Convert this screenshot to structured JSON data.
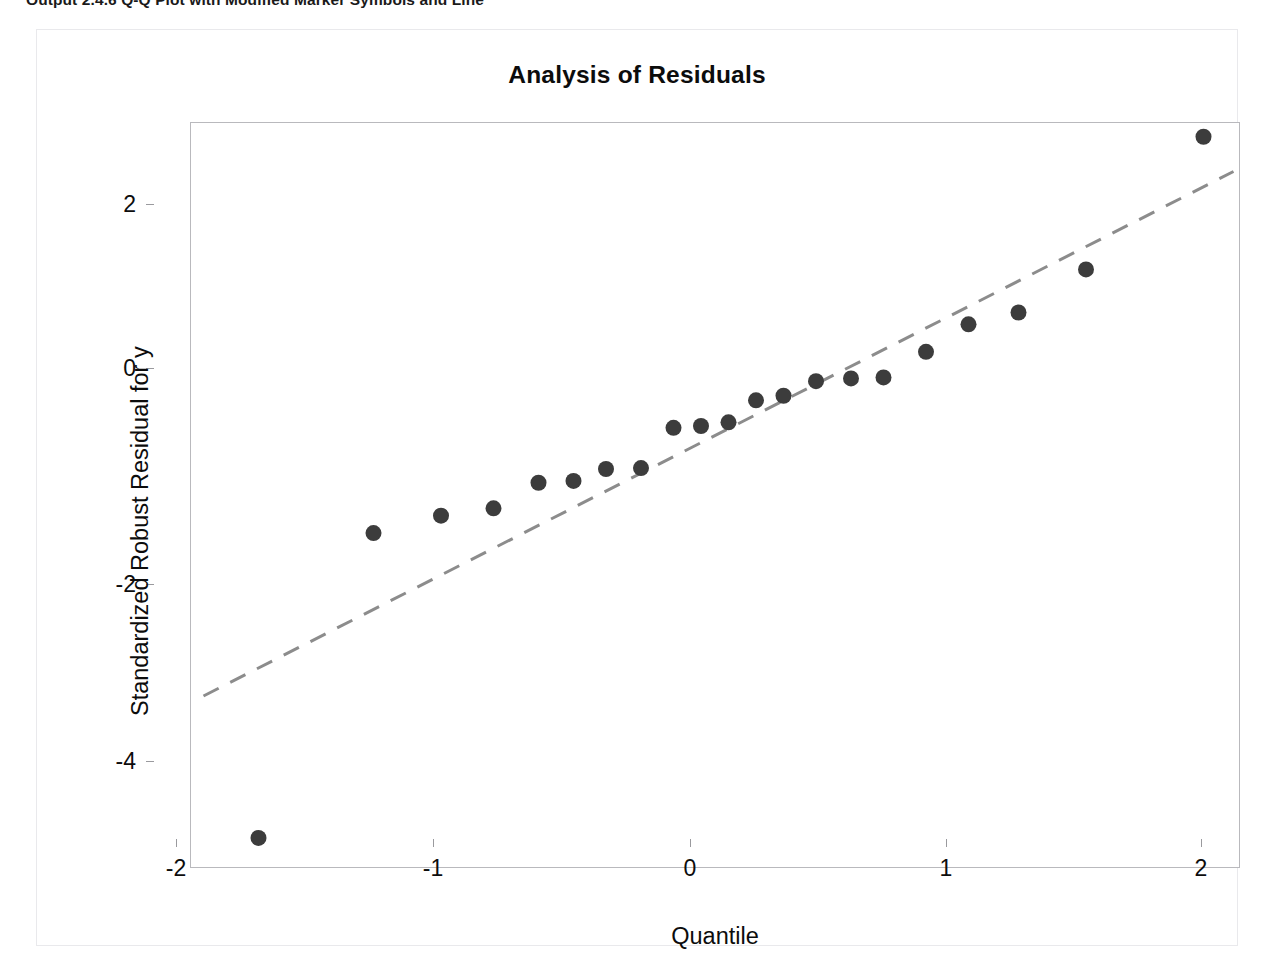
{
  "caption": {
    "text": "Output 2.4.6  Q-Q Plot with Modified Marker Symbols and Line"
  },
  "graph": {
    "title": "Analysis of Residuals",
    "x_axis_title": "Quantile",
    "y_axis_title": "Standardized Robust Residual for y"
  },
  "colors": {
    "marker": "#3c3c3c",
    "reference_line": "#8c8c8c",
    "frame": "#b9b9bd",
    "panel_border": "#e9e9ec",
    "text": "#0c0c0c",
    "background": "#ffffff"
  },
  "chart_data": {
    "type": "scatter",
    "title": "Analysis of Residuals",
    "xlabel": "Quantile",
    "ylabel": "Standardized Robust Residual for y",
    "xlim": [
      -2.15,
      2.05
    ],
    "ylim": [
      -5.0,
      3.15
    ],
    "xticks": [
      -2,
      -1,
      0,
      1,
      2
    ],
    "yticks": [
      2,
      0,
      -2,
      -4
    ],
    "grid": false,
    "legend": null,
    "series": [
      {
        "name": "Standardized Robust Residual for y",
        "marker": "filled-circle",
        "marker_color": "#3c3c3c",
        "marker_size": 16,
        "x": [
          -1.88,
          -1.42,
          -1.15,
          -0.94,
          -0.76,
          -0.62,
          -0.49,
          -0.35,
          -0.22,
          -0.11,
          0.0,
          0.11,
          0.22,
          0.35,
          0.49,
          0.62,
          0.79,
          0.96,
          1.16,
          1.43,
          1.9
        ],
        "y": [
          -4.66,
          -1.33,
          -1.14,
          -1.06,
          -0.78,
          -0.76,
          -0.63,
          -0.62,
          -0.18,
          -0.16,
          -0.12,
          0.12,
          0.17,
          0.33,
          0.36,
          0.37,
          0.65,
          0.95,
          1.08,
          1.55,
          3.0
        ]
      }
    ],
    "reference_line": {
      "name": "normal-reference-line",
      "style": "dashed",
      "color": "#8c8c8c",
      "width": 3,
      "x": [
        -2.1,
        2.02
      ],
      "y": [
        -3.11,
        2.62
      ]
    }
  },
  "y_tick_positions": [
    {
      "label": "2",
      "top": 203
    },
    {
      "label": "0",
      "top": 367
    },
    {
      "label": "-2",
      "top": 583
    },
    {
      "label": "-4",
      "top": 760
    }
  ],
  "x_tick_positions": [
    {
      "label": "-2",
      "left": 175
    },
    {
      "label": "-1",
      "left": 432
    },
    {
      "label": "0",
      "left": 689
    },
    {
      "label": "1",
      "left": 945
    },
    {
      "label": "2",
      "left": 1200
    }
  ]
}
